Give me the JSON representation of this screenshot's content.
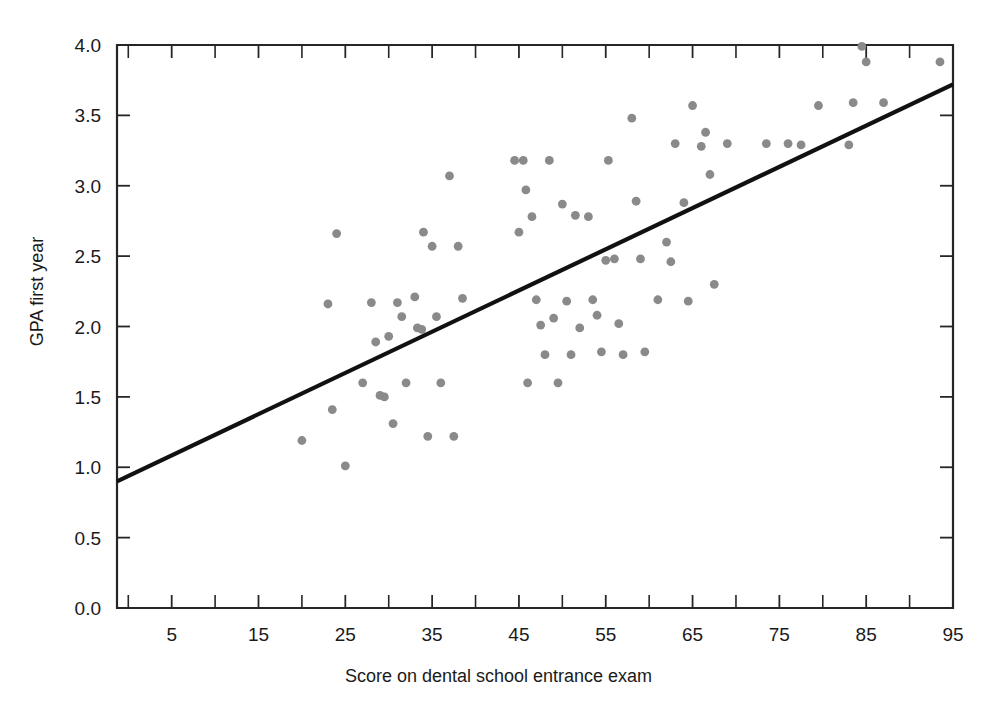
{
  "chart_data": {
    "type": "scatter",
    "title": "",
    "subtitle": "",
    "xlabel": "Score on dental school entrance exam",
    "ylabel": "GPA first year",
    "xlim": [
      -1.3,
      95.0
    ],
    "ylim": [
      0.0,
      4.0
    ],
    "grid": false,
    "legend": null,
    "x_ticks_major": [
      5,
      15,
      25,
      35,
      45,
      55,
      65,
      75,
      85,
      95
    ],
    "x_tick_labels": [
      "5",
      "15",
      "25",
      "35",
      "45",
      "55",
      "65",
      "75",
      "85",
      "95"
    ],
    "x_ticks_minor": [
      0,
      10,
      20,
      30,
      40,
      50,
      60,
      70,
      80,
      90
    ],
    "y_ticks_major": [
      0.0,
      0.5,
      1.0,
      1.5,
      2.0,
      2.5,
      3.0,
      3.5,
      4.0
    ],
    "y_tick_labels": [
      "0.0",
      "0.5",
      "1.0",
      "1.5",
      "2.0",
      "2.5",
      "3.0",
      "3.5",
      "4.0"
    ],
    "marker_color": "#8a8a8a",
    "line_color": "#111111",
    "axis_color": "#262626",
    "background_color": "#ffffff",
    "trendline": {
      "label": "least-squares regression line",
      "x_start": -1.3,
      "y_start": 0.9,
      "x_end": 95.0,
      "y_end": 3.72
    },
    "points": [
      {
        "x": 20.0,
        "y": 1.19
      },
      {
        "x": 23.0,
        "y": 2.16
      },
      {
        "x": 23.5,
        "y": 1.41
      },
      {
        "x": 24.0,
        "y": 2.66
      },
      {
        "x": 25.0,
        "y": 1.01
      },
      {
        "x": 27.0,
        "y": 1.6
      },
      {
        "x": 28.0,
        "y": 2.17
      },
      {
        "x": 28.5,
        "y": 1.89
      },
      {
        "x": 29.0,
        "y": 1.51
      },
      {
        "x": 29.5,
        "y": 1.5
      },
      {
        "x": 30.0,
        "y": 1.93
      },
      {
        "x": 30.5,
        "y": 1.31
      },
      {
        "x": 31.0,
        "y": 2.17
      },
      {
        "x": 31.5,
        "y": 2.07
      },
      {
        "x": 32.0,
        "y": 1.6
      },
      {
        "x": 33.0,
        "y": 2.21
      },
      {
        "x": 33.3,
        "y": 1.99
      },
      {
        "x": 33.8,
        "y": 1.98
      },
      {
        "x": 34.0,
        "y": 2.67
      },
      {
        "x": 34.5,
        "y": 1.22
      },
      {
        "x": 35.0,
        "y": 2.57
      },
      {
        "x": 35.5,
        "y": 2.07
      },
      {
        "x": 36.0,
        "y": 1.6
      },
      {
        "x": 37.0,
        "y": 3.07
      },
      {
        "x": 37.5,
        "y": 1.22
      },
      {
        "x": 38.0,
        "y": 2.57
      },
      {
        "x": 38.5,
        "y": 2.2
      },
      {
        "x": 44.5,
        "y": 3.18
      },
      {
        "x": 45.0,
        "y": 2.67
      },
      {
        "x": 45.5,
        "y": 3.18
      },
      {
        "x": 45.8,
        "y": 2.97
      },
      {
        "x": 46.0,
        "y": 1.6
      },
      {
        "x": 46.5,
        "y": 2.78
      },
      {
        "x": 47.0,
        "y": 2.19
      },
      {
        "x": 47.5,
        "y": 2.01
      },
      {
        "x": 48.0,
        "y": 1.8
      },
      {
        "x": 48.5,
        "y": 3.18
      },
      {
        "x": 49.0,
        "y": 2.06
      },
      {
        "x": 49.5,
        "y": 1.6
      },
      {
        "x": 50.0,
        "y": 2.87
      },
      {
        "x": 50.5,
        "y": 2.18
      },
      {
        "x": 51.0,
        "y": 1.8
      },
      {
        "x": 51.5,
        "y": 2.79
      },
      {
        "x": 52.0,
        "y": 1.99
      },
      {
        "x": 53.0,
        "y": 2.78
      },
      {
        "x": 53.5,
        "y": 2.19
      },
      {
        "x": 54.0,
        "y": 2.08
      },
      {
        "x": 54.5,
        "y": 1.82
      },
      {
        "x": 55.0,
        "y": 2.47
      },
      {
        "x": 55.3,
        "y": 3.18
      },
      {
        "x": 56.0,
        "y": 2.48
      },
      {
        "x": 56.5,
        "y": 2.02
      },
      {
        "x": 57.0,
        "y": 1.8
      },
      {
        "x": 58.0,
        "y": 3.48
      },
      {
        "x": 58.5,
        "y": 2.89
      },
      {
        "x": 59.0,
        "y": 2.48
      },
      {
        "x": 59.5,
        "y": 1.82
      },
      {
        "x": 61.0,
        "y": 2.19
      },
      {
        "x": 62.0,
        "y": 2.6
      },
      {
        "x": 62.5,
        "y": 2.46
      },
      {
        "x": 63.0,
        "y": 3.3
      },
      {
        "x": 64.0,
        "y": 2.88
      },
      {
        "x": 64.5,
        "y": 2.18
      },
      {
        "x": 65.0,
        "y": 3.57
      },
      {
        "x": 66.0,
        "y": 3.28
      },
      {
        "x": 66.5,
        "y": 3.38
      },
      {
        "x": 67.0,
        "y": 3.08
      },
      {
        "x": 67.5,
        "y": 2.3
      },
      {
        "x": 69.0,
        "y": 3.3
      },
      {
        "x": 73.5,
        "y": 3.3
      },
      {
        "x": 76.0,
        "y": 3.3
      },
      {
        "x": 77.5,
        "y": 3.29
      },
      {
        "x": 79.5,
        "y": 3.57
      },
      {
        "x": 83.0,
        "y": 3.29
      },
      {
        "x": 83.5,
        "y": 3.59
      },
      {
        "x": 84.5,
        "y": 3.99
      },
      {
        "x": 85.0,
        "y": 3.88
      },
      {
        "x": 87.0,
        "y": 3.59
      },
      {
        "x": 93.5,
        "y": 3.88
      }
    ]
  }
}
